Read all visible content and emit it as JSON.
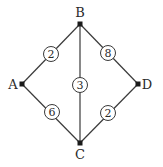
{
  "diagram": {
    "type": "weighted-graph",
    "nodes": [
      {
        "id": "A",
        "label": "A",
        "x": 22,
        "y": 84,
        "lx": 13,
        "ly": 89
      },
      {
        "id": "B",
        "label": "B",
        "x": 80,
        "y": 24,
        "lx": 80,
        "ly": 17
      },
      {
        "id": "C",
        "label": "C",
        "x": 80,
        "y": 143,
        "lx": 80,
        "ly": 159
      },
      {
        "id": "D",
        "label": "D",
        "x": 138,
        "y": 84,
        "lx": 147,
        "ly": 89
      }
    ],
    "edges": [
      {
        "from": "A",
        "to": "B",
        "weight": "2",
        "wx": 51,
        "wy": 54
      },
      {
        "from": "B",
        "to": "D",
        "weight": "8",
        "wx": 108,
        "wy": 53
      },
      {
        "from": "B",
        "to": "C",
        "weight": "3",
        "wx": 80,
        "wy": 85
      },
      {
        "from": "A",
        "to": "C",
        "weight": "6",
        "wx": 52,
        "wy": 112
      },
      {
        "from": "C",
        "to": "D",
        "weight": "2",
        "wx": 108,
        "wy": 113
      }
    ]
  }
}
